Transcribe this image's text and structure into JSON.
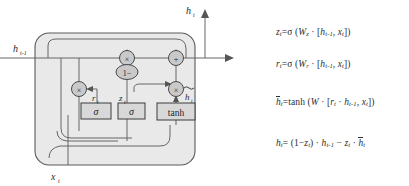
{
  "figure": {
    "title_present": false,
    "colors": {
      "background": "#ffffff",
      "cell_fill": "#e9e9e9",
      "cell_stroke": "#5a5a5a",
      "node_fill": "#c9c9c9",
      "node_stroke": "#4a4a4a",
      "box_fill": "#d8d8d8",
      "box_stroke": "#3c3c3c",
      "line": "#555555",
      "text": "#2b2b2b"
    },
    "labels": {
      "input_hidden": "h",
      "input_hidden_sub": "t-1",
      "input_x": "x",
      "input_x_sub": "t",
      "output_h": "h",
      "output_h_sub": "t",
      "reset_gate": "r",
      "reset_gate_sub": "t",
      "update_gate": "z",
      "update_gate_sub": "t",
      "candidate": "h",
      "candidate_sub": "t",
      "one_minus": "1−",
      "sigma": "σ",
      "tanh": "tanh",
      "multiply": "×",
      "add": "+"
    },
    "nodes": [
      {
        "name": "reset-multiply-node",
        "op": "×"
      },
      {
        "name": "update-multiply-node",
        "op": "×"
      },
      {
        "name": "candidate-multiply-node",
        "op": "×"
      },
      {
        "name": "output-add-node",
        "op": "+"
      },
      {
        "name": "one-minus-node",
        "op": "1−"
      }
    ],
    "activation_boxes": [
      {
        "name": "reset-sigma-box",
        "label": "σ"
      },
      {
        "name": "update-sigma-box",
        "label": "σ"
      },
      {
        "name": "tanh-box",
        "label": "tanh"
      }
    ]
  },
  "equations": [
    {
      "id": "update-gate-equation",
      "lhs_var": "z",
      "lhs_sub": "t",
      "text": "z_t=σ (W_z · [h_{t-1}, x_t])"
    },
    {
      "id": "reset-gate-equation",
      "lhs_var": "r",
      "lhs_sub": "t",
      "text": "r_t=σ (W_r · [h_{t-1}, x_t])"
    },
    {
      "id": "candidate-equation",
      "lhs_var": "h",
      "lhs_sub": "t",
      "text": "h̃_t=tanh (W · [r_t · h_{t-1}, x_t])"
    },
    {
      "id": "output-equation",
      "lhs_var": "h",
      "lhs_sub": "t",
      "text": "h_t= (1−z_t) · h_{t-1} − z_t · h̃_t"
    }
  ],
  "equation_tokens": {
    "sigma": "σ",
    "tanh": "tanh",
    "dot": "·",
    "W": "W",
    "eq": "=",
    "open_paren": "(",
    "close_paren": ")",
    "open_bracket": "[",
    "close_bracket": "]",
    "comma": ",",
    "minus": "−",
    "one": "1"
  }
}
